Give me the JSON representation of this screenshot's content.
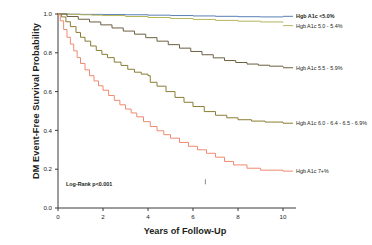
{
  "chart_data": {
    "type": "line",
    "title": "",
    "xlabel": "Years of Follow-Up",
    "ylabel": "DM Event-Free Survival Probability",
    "xlim": [
      0,
      10
    ],
    "ylim": [
      0.0,
      1.0
    ],
    "xticks": [
      "0",
      "2",
      "4",
      "6",
      "8",
      "10"
    ],
    "xtick_values": [
      0,
      2,
      4,
      6,
      8,
      10
    ],
    "yticks": [
      "0.0",
      "0.2",
      "0.4",
      "0.6",
      "0.8",
      "1.0"
    ],
    "ytick_values": [
      0.0,
      0.2,
      0.4,
      0.6,
      0.8,
      1.0
    ],
    "grid": false,
    "legend_position": "right-inline",
    "annotation": "Log-Rank p<0.001",
    "series": [
      {
        "name": "Hgb A1c <5.0%",
        "color": "#5a7fb5",
        "label_bold": true,
        "label_x": 10.0,
        "label_y": 0.988,
        "x": [
          0.0,
          0.5,
          1.0,
          2.0,
          3.0,
          4.0,
          5.0,
          6.0,
          7.0,
          8.0,
          9.0,
          10.0
        ],
        "y": [
          1.0,
          0.999,
          0.998,
          0.997,
          0.996,
          0.994,
          0.992,
          0.99,
          0.988,
          0.986,
          0.985,
          0.984
        ]
      },
      {
        "name": "Hgb A1c 5.0 - 5.4%",
        "color": "#b5b55a",
        "label_bold": false,
        "label_x": 10.0,
        "label_y": 0.94,
        "x": [
          0.0,
          0.5,
          1.0,
          1.5,
          2.0,
          3.0,
          4.0,
          5.0,
          6.0,
          7.0,
          8.0,
          9.0,
          10.0
        ],
        "y": [
          1.0,
          0.998,
          0.996,
          0.994,
          0.992,
          0.987,
          0.982,
          0.977,
          0.972,
          0.967,
          0.963,
          0.959,
          0.956
        ]
      },
      {
        "name": "Hgb A1c 5.5 - 5.9%",
        "color": "#6b6040",
        "label_bold": false,
        "label_x": 10.0,
        "label_y": 0.723,
        "x": [
          0.0,
          0.4,
          0.9,
          1.4,
          1.9,
          2.4,
          2.9,
          3.4,
          3.9,
          4.4,
          4.9,
          5.4,
          5.9,
          6.4,
          6.9,
          7.4,
          7.9,
          8.4,
          8.9,
          9.4,
          10.0
        ],
        "y": [
          1.0,
          0.987,
          0.973,
          0.959,
          0.944,
          0.928,
          0.912,
          0.896,
          0.878,
          0.86,
          0.842,
          0.824,
          0.807,
          0.79,
          0.774,
          0.76,
          0.75,
          0.742,
          0.736,
          0.731,
          0.727
        ]
      },
      {
        "name": "Hgb A1c 6.0 - 6.4 - 6.5 - 6.9%",
        "color": "#8a7d35",
        "label_bold": false,
        "label_x": 10.0,
        "label_y": 0.437,
        "x": [
          0.0,
          0.15,
          0.35,
          0.55,
          0.8,
          1.0,
          1.2,
          1.45,
          1.7,
          1.95,
          2.2,
          2.5,
          2.8,
          3.1,
          3.4,
          3.7,
          4.0,
          4.1,
          4.4,
          4.8,
          5.2,
          5.6,
          6.0,
          6.5,
          7.0,
          7.5,
          8.0,
          8.6,
          9.2,
          10.0
        ],
        "y": [
          1.0,
          0.985,
          0.96,
          0.935,
          0.905,
          0.88,
          0.86,
          0.835,
          0.812,
          0.792,
          0.775,
          0.752,
          0.735,
          0.715,
          0.7,
          0.69,
          0.682,
          0.648,
          0.628,
          0.6,
          0.57,
          0.545,
          0.523,
          0.497,
          0.478,
          0.465,
          0.455,
          0.448,
          0.443,
          0.438
        ]
      },
      {
        "name": "Hgb A1c 7+%",
        "color": "#ef8a70",
        "label_bold": false,
        "label_x": 10.0,
        "label_y": 0.19,
        "x": [
          0.0,
          0.1,
          0.25,
          0.4,
          0.55,
          0.7,
          0.85,
          1.0,
          1.2,
          1.4,
          1.6,
          1.8,
          2.0,
          2.25,
          2.5,
          2.75,
          3.0,
          3.25,
          3.5,
          3.8,
          4.1,
          4.4,
          4.7,
          5.0,
          5.4,
          5.8,
          6.2,
          6.6,
          7.0,
          7.4,
          7.8,
          8.4,
          9.0,
          10.0
        ],
        "y": [
          1.0,
          0.965,
          0.92,
          0.88,
          0.845,
          0.81,
          0.775,
          0.745,
          0.712,
          0.682,
          0.655,
          0.63,
          0.607,
          0.58,
          0.555,
          0.532,
          0.51,
          0.49,
          0.47,
          0.445,
          0.42,
          0.398,
          0.378,
          0.36,
          0.338,
          0.318,
          0.3,
          0.282,
          0.262,
          0.24,
          0.222,
          0.205,
          0.195,
          0.19
        ]
      }
    ],
    "censor_marks": [
      {
        "x": 6.55,
        "y": 0.135,
        "series": "Hgb A1c 7+%"
      }
    ]
  }
}
